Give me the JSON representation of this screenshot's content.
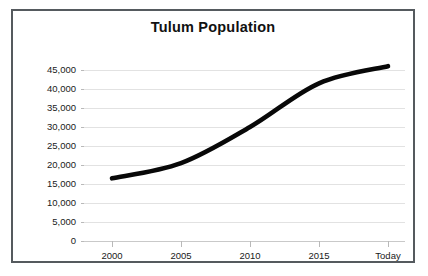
{
  "chart_data": {
    "type": "line",
    "title": "Tulum Population",
    "xlabel": "",
    "ylabel": "",
    "categories": [
      "2000",
      "2005",
      "2010",
      "2015",
      "Today"
    ],
    "x": [
      "2000",
      "2005",
      "2010",
      "2015",
      "Today"
    ],
    "values": [
      16500,
      20500,
      30000,
      41500,
      46000
    ],
    "series": [
      {
        "name": "Tulum Population",
        "values": [
          16500,
          20500,
          30000,
          41500,
          46000
        ]
      }
    ],
    "ylim": [
      0,
      45000
    ],
    "y_ticks": [
      0,
      5000,
      10000,
      15000,
      20000,
      25000,
      30000,
      35000,
      40000,
      45000
    ],
    "y_tick_labels": [
      "0",
      "5,000",
      "10,000",
      "15,000",
      "20,000",
      "25,000",
      "30,000",
      "35,000",
      "40,000",
      "45,000"
    ],
    "x_tick_labels": [
      "2000",
      "2005",
      "2010",
      "2015",
      "Today"
    ],
    "grid": true,
    "legend": false,
    "legend_position": "none",
    "line_color": "#080808",
    "gridline_color": "#e2e2e2",
    "frame_color": "#555a5e",
    "background_color": "#ffffff"
  }
}
